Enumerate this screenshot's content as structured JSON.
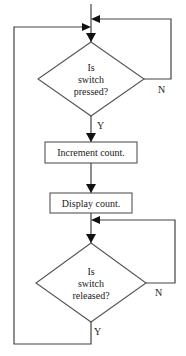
{
  "diagram": {
    "type": "flowchart",
    "nodes": [
      {
        "id": "decision-pressed",
        "shape": "diamond",
        "lines": [
          "Is",
          "switch",
          "pressed?"
        ]
      },
      {
        "id": "increment",
        "shape": "rectangle",
        "label": "Increment count."
      },
      {
        "id": "display",
        "shape": "rectangle",
        "label": "Display count."
      },
      {
        "id": "decision-released",
        "shape": "diamond",
        "lines": [
          "Is",
          "switch",
          "released?"
        ]
      }
    ],
    "edges": [
      {
        "from": "decision-pressed",
        "to": "decision-pressed",
        "label": "N"
      },
      {
        "from": "decision-pressed",
        "to": "increment",
        "label": "Y"
      },
      {
        "from": "increment",
        "to": "display",
        "label": ""
      },
      {
        "from": "display",
        "to": "decision-released",
        "label": ""
      },
      {
        "from": "decision-released",
        "to": "decision-released",
        "label": "N"
      },
      {
        "from": "decision-released",
        "to": "decision-pressed",
        "label": "Y"
      }
    ],
    "labels": {
      "yes": "Y",
      "no": "N"
    },
    "colors": {
      "line": "#444444",
      "arrow": "#111111",
      "background": "#ffffff"
    }
  }
}
